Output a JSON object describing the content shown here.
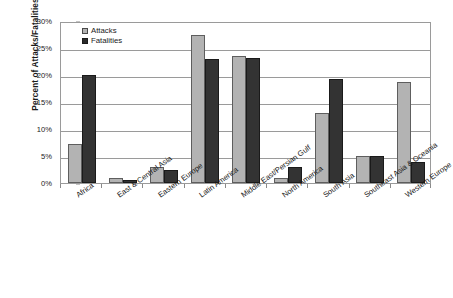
{
  "chart_data": {
    "type": "bar",
    "title": "",
    "subtitle": "",
    "xlabel": "",
    "ylabel": "Percent of Attacks/Fatalities",
    "ylim": [
      0,
      30
    ],
    "ytick_labels": [
      "30%",
      "25%",
      "20%",
      "15%",
      "10%",
      "5%",
      "0%"
    ],
    "ytick_values": [
      30,
      25,
      20,
      15,
      10,
      5,
      0
    ],
    "grid": true,
    "legend_position": "top-left inside plot",
    "categories": [
      "Africa",
      "East & Central Asia",
      "Eastern Europe",
      "Latin America",
      "Middle East/Persian Gulf",
      "North America",
      "South Asia",
      "Southeast Asia & Oceania",
      "Western Europe"
    ],
    "series": [
      {
        "name": "Attacks",
        "color": "#b3b3b3",
        "values": [
          7.2,
          1.0,
          3.0,
          27.5,
          23.5,
          1.0,
          13.0,
          5.0,
          18.7
        ]
      },
      {
        "name": "Fatalities",
        "color": "#2b2b2b",
        "values": [
          20.0,
          0.5,
          2.4,
          23.0,
          23.2,
          3.0,
          19.2,
          5.0,
          3.8
        ]
      }
    ]
  },
  "legend": {
    "items": [
      {
        "label": "Attacks",
        "swatch": "light-gray-square"
      },
      {
        "label": "Fatalities",
        "swatch": "dark-square"
      }
    ]
  },
  "axes": {
    "y_title": "Percent of Attacks/Fatalities"
  },
  "colors": {
    "attacks": "#b3b3b3",
    "fatalities": "#2b2b2b",
    "gridline": "#9a9a9a",
    "plot_border": "#9a9a9a",
    "background": "#ffffff",
    "text": "#1a1a1a"
  }
}
